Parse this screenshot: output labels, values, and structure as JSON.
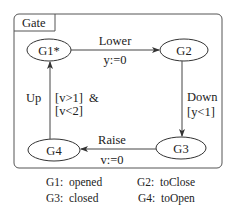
{
  "diagram": {
    "container_label": "Gate",
    "states": [
      {
        "id": "G1",
        "label": "G1*",
        "initial": true
      },
      {
        "id": "G2",
        "label": "G2"
      },
      {
        "id": "G3",
        "label": "G3"
      },
      {
        "id": "G4",
        "label": "G4"
      }
    ],
    "transitions": [
      {
        "from": "G1",
        "to": "G2",
        "event": "Lower",
        "action": "y:=0"
      },
      {
        "from": "G2",
        "to": "G3",
        "event": "Down",
        "guard": "[y<1]"
      },
      {
        "from": "G3",
        "to": "G4",
        "event": "Raise",
        "action": "v:=0"
      },
      {
        "from": "G4",
        "to": "G1",
        "event": "Up",
        "guard_line1": "[v>1]  &",
        "guard_line2": "[v<2]"
      }
    ],
    "legend": [
      {
        "key": "G1:",
        "value": "opened"
      },
      {
        "key": "G2:",
        "value": "toClose"
      },
      {
        "key": "G3:",
        "value": "closed"
      },
      {
        "key": "G4:",
        "value": "toOpen"
      }
    ]
  }
}
